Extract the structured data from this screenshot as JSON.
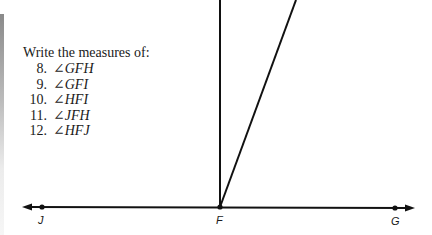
{
  "problem": {
    "prompt": "Write the measures of:",
    "items": [
      {
        "number": "8.",
        "angle": "∠GFH"
      },
      {
        "number": "9.",
        "angle": "∠GFI"
      },
      {
        "number": "10.",
        "angle": "∠HFI"
      },
      {
        "number": "11.",
        "angle": "∠JFH"
      },
      {
        "number": "12.",
        "angle": "∠HFJ"
      }
    ]
  },
  "figure": {
    "points": {
      "J": {
        "label": "J"
      },
      "F": {
        "label": "F"
      },
      "G": {
        "label": "G"
      }
    },
    "line_color": "#111111"
  }
}
